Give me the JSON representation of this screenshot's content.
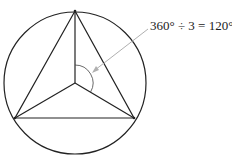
{
  "diagram": {
    "annotation": "360° ÷ 3 = 120°",
    "colors": {
      "stroke": "#222222",
      "arrow": "#b0b0b0",
      "background": "#ffffff"
    },
    "circle": {
      "cx": 75,
      "cy": 83,
      "r": 71
    },
    "center": {
      "x": 75,
      "y": 83
    },
    "vertices": [
      {
        "name": "top",
        "x": 75,
        "y": 11
      },
      {
        "name": "bottom-left",
        "x": 15,
        "y": 118
      },
      {
        "name": "bottom-right",
        "x": 134,
        "y": 118
      }
    ],
    "angle_arc": {
      "radius": 18,
      "degrees": 120
    }
  }
}
